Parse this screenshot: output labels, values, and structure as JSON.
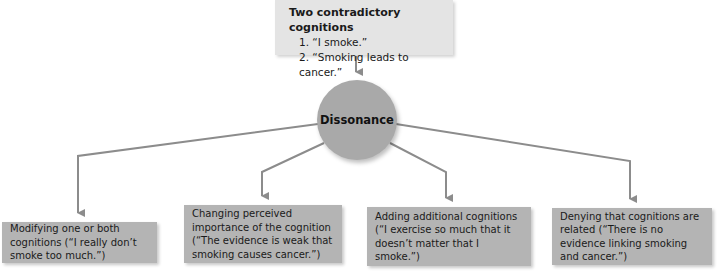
{
  "diagram": {
    "top_box": {
      "title": "Two contradictory cognitions",
      "items": [
        "1. “I smoke.”",
        "2. “Smoking leads to cancer.”"
      ]
    },
    "center": {
      "label": "Dissonance"
    },
    "outcomes": [
      {
        "label": "Modifying one or both cognitions (“I really don’t smoke too much.”)"
      },
      {
        "label": "Changing perceived importance of the cognition (“The evidence is weak that smoking causes cancer.”)"
      },
      {
        "label": "Adding additional cognitions (“I exercise so much that it doesn’t matter that I smoke.”)"
      },
      {
        "label": "Denying that cognitions are related (“There is no evidence linking smoking and cancer.”)"
      }
    ],
    "colors": {
      "top_box": "#e4e4e4",
      "circle": "#a9a9a9",
      "outcome_box": "#b4b4b4",
      "connector": "#8c8c8c"
    }
  }
}
